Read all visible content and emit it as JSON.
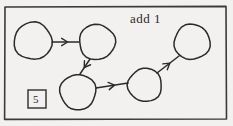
{
  "figure": {
    "kind": "hand-drawn-state-diagram",
    "background_color": "#f2f1ef",
    "ink_color": "#2b2b2b",
    "border": {
      "name": "outer-frame",
      "x": 5,
      "y": 7,
      "width": 221,
      "height": 112,
      "stroke": "#3a3a3a",
      "stroke_width": 1.6
    },
    "annotation": {
      "label": "add 1",
      "x": 130,
      "y": 11
    },
    "counter_box": {
      "label": "5",
      "x": 28,
      "y": 90,
      "width": 18,
      "height": 18,
      "stroke": "#3a3a3a"
    },
    "nodes": [
      {
        "id": "n1",
        "name": "node-top-left",
        "cx": 33,
        "cy": 41,
        "r": 19
      },
      {
        "id": "n2",
        "name": "node-top-middle",
        "cx": 97,
        "cy": 42,
        "r": 18
      },
      {
        "id": "n3",
        "name": "node-bottom-left",
        "cx": 78,
        "cy": 92,
        "r": 18
      },
      {
        "id": "n4",
        "name": "node-bottom-middle",
        "cx": 145,
        "cy": 85,
        "r": 17
      },
      {
        "id": "n5",
        "name": "node-top-right",
        "cx": 192,
        "cy": 42,
        "r": 18
      }
    ],
    "edges": [
      {
        "name": "edge-n1-to-n2",
        "from": "n1",
        "to": "n2",
        "x1": 52,
        "y1": 42,
        "x2": 79,
        "y2": 42
      },
      {
        "name": "edge-n2-to-n3",
        "from": "n2",
        "to": "n3",
        "x1": 90,
        "y1": 59,
        "x2": 80,
        "y2": 74
      },
      {
        "name": "edge-n3-to-n4",
        "from": "n3",
        "to": "n4",
        "x1": 96,
        "y1": 88,
        "x2": 128,
        "y2": 83
      },
      {
        "name": "edge-n4-to-n5",
        "from": "n4",
        "to": "n5",
        "x1": 157,
        "y1": 73,
        "x2": 179,
        "y2": 56
      }
    ]
  }
}
